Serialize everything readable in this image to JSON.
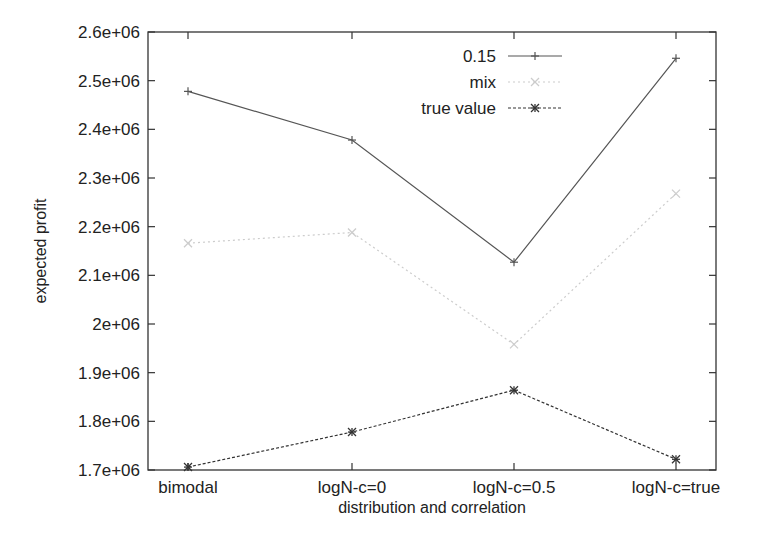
{
  "chart_data": {
    "type": "line",
    "title": "",
    "xlabel": "distribution and correlation",
    "ylabel": "expected profit",
    "categories": [
      "bimodal",
      "logN-c=0",
      "logN-c=0.5",
      "logN-c=true"
    ],
    "ylim": [
      1700000,
      2600000
    ],
    "yticks": [
      1700000,
      1800000,
      1900000,
      2000000,
      2100000,
      2200000,
      2300000,
      2400000,
      2500000,
      2600000
    ],
    "ytick_labels": [
      "1.7e+06",
      "1.8e+06",
      "1.9e+06",
      "2e+06",
      "2.1e+06",
      "2.2e+06",
      "2.3e+06",
      "2.4e+06",
      "2.5e+06",
      "2.6e+06"
    ],
    "grid": false,
    "legend_position": "top-center-right",
    "series": [
      {
        "name": "0.15",
        "values": [
          2478000,
          2378000,
          2127000,
          2546000
        ],
        "color": "#555555",
        "style": "solid",
        "marker": "plus"
      },
      {
        "name": "mix",
        "values": [
          2166000,
          2188000,
          1958000,
          2268000
        ],
        "color": "#cccccc",
        "style": "dotted",
        "marker": "cross"
      },
      {
        "name": "true value",
        "values": [
          1706000,
          1778000,
          1864000,
          1722000
        ],
        "color": "#333333",
        "style": "dashed",
        "marker": "star"
      }
    ]
  }
}
